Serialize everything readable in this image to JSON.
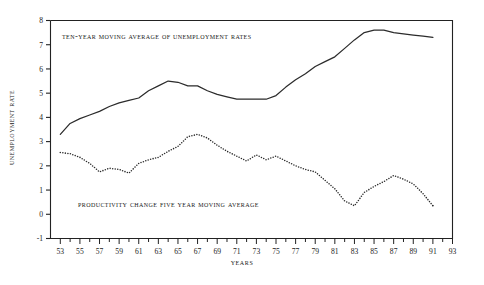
{
  "chart_data": {
    "type": "line",
    "title": "",
    "xlabel": "Years",
    "ylabel": "Unemployment Rate",
    "xlim": [
      52,
      93
    ],
    "ylim": [
      -1,
      8
    ],
    "grid": false,
    "legend_position": "inline-annotations",
    "y_ticks": [
      "-1",
      "0",
      "1",
      "2",
      "3",
      "4",
      "5",
      "6",
      "7",
      "8"
    ],
    "y_tick_values": [
      -1,
      0,
      1,
      2,
      3,
      4,
      5,
      6,
      7,
      8
    ],
    "x_ticks": [
      "53",
      "55",
      "57",
      "59",
      "61",
      "63",
      "65",
      "67",
      "69",
      "71",
      "73",
      "75",
      "77",
      "79",
      "81",
      "83",
      "85",
      "87",
      "89",
      "91",
      "93"
    ],
    "x_tick_values": [
      53,
      55,
      57,
      59,
      61,
      63,
      65,
      67,
      69,
      71,
      73,
      75,
      77,
      79,
      81,
      83,
      85,
      87,
      89,
      91,
      93
    ],
    "x_minor_step": 1,
    "annotations": [
      {
        "id": "label-unemployment",
        "text": "Ten-Year Moving Average of Unemployment Rates"
      },
      {
        "id": "label-productivity",
        "text": "Productivity Change Five Year Moving Average"
      }
    ],
    "x": [
      53,
      54,
      55,
      56,
      57,
      58,
      59,
      60,
      61,
      62,
      63,
      64,
      65,
      66,
      67,
      68,
      69,
      70,
      71,
      72,
      73,
      74,
      75,
      76,
      77,
      78,
      79,
      80,
      81,
      82,
      83,
      84,
      85,
      86,
      87,
      88,
      89,
      90,
      91
    ],
    "series": [
      {
        "name": "Ten-Year Moving Average of Unemployment Rates",
        "style": "solid",
        "color": "#2b2b2b",
        "values": [
          3.3,
          3.75,
          3.95,
          4.1,
          4.25,
          4.45,
          4.6,
          4.7,
          4.8,
          5.1,
          5.3,
          5.5,
          5.45,
          5.3,
          5.3,
          5.1,
          4.95,
          4.85,
          4.75,
          4.75,
          4.75,
          4.75,
          4.9,
          5.25,
          5.55,
          5.8,
          6.1,
          6.3,
          6.5,
          6.85,
          7.2,
          7.5,
          7.6,
          7.6,
          7.5,
          7.45,
          7.4,
          7.35,
          7.3
        ]
      },
      {
        "name": "Productivity Change Five Year Moving Average",
        "style": "dotted",
        "color": "#2b2b2b",
        "values": [
          2.55,
          2.5,
          2.35,
          2.1,
          1.75,
          1.9,
          1.85,
          1.7,
          2.1,
          2.25,
          2.35,
          2.6,
          2.8,
          3.2,
          3.3,
          3.15,
          2.85,
          2.6,
          2.4,
          2.2,
          2.45,
          2.25,
          2.4,
          2.2,
          2.0,
          1.85,
          1.75,
          1.4,
          1.05,
          0.55,
          0.35,
          0.9,
          1.15,
          1.35,
          1.6,
          1.45,
          1.25,
          0.85,
          0.35
        ]
      }
    ]
  }
}
